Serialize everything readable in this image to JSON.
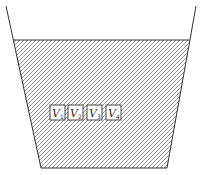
{
  "diagram": {
    "type": "container-with-liquid",
    "colors": {
      "stroke": "#333333",
      "hatch": "#555555",
      "background": "#ffffff",
      "box_fill": "#ffffff"
    },
    "blocks": [
      {
        "label": "V",
        "subscript": "1"
      },
      {
        "label": "V",
        "subscript": "2"
      },
      {
        "label": "V",
        "subscript": "3"
      },
      {
        "label": "V",
        "subscript": "4"
      }
    ]
  }
}
